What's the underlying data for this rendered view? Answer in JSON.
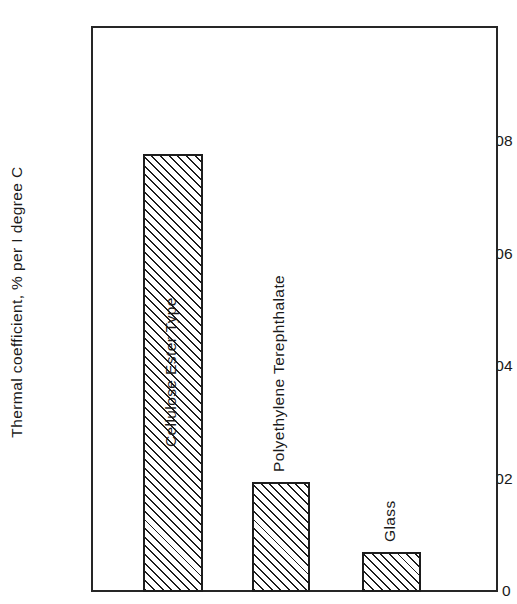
{
  "chart_data": {
    "type": "bar",
    "title": "",
    "xlabel": "",
    "ylabel": "Thermal coefficient, % per I degree C",
    "categories": [
      "Cellulose Ester Type",
      "Polyethylene Terephthalate",
      "Glass"
    ],
    "values": [
      0.0078,
      0.00198,
      0.00073
    ],
    "ylim": [
      0,
      0.01
    ],
    "yticks": [
      "0",
      "0.002",
      "0.004",
      "0.006",
      "0.008"
    ],
    "ytick_values": [
      0,
      0.002,
      0.004,
      0.006,
      0.008
    ],
    "grid": false,
    "legend": "none",
    "bar_fill": "diagonal-hatch",
    "bar_edge_color": "#1d1d1d",
    "frame_color": "#262626",
    "background": "#ffffff"
  },
  "axis": {
    "y_title": "Thermal coefficient, % per I degree C",
    "ticks": [
      {
        "label": "0.008",
        "value": 0.008
      },
      {
        "label": "0.006",
        "value": 0.006
      },
      {
        "label": "0.004",
        "value": 0.004
      },
      {
        "label": "0.002",
        "value": 0.002
      },
      {
        "label": "0",
        "value": 0
      }
    ]
  },
  "bars": [
    {
      "label": "Cellulose Ester Type",
      "value": 0.0078,
      "label_inside": true
    },
    {
      "label": "Polyethylene Terephthalate",
      "value": 0.00198,
      "label_inside": false
    },
    {
      "label": "Glass",
      "value": 0.00073,
      "label_inside": false
    }
  ]
}
